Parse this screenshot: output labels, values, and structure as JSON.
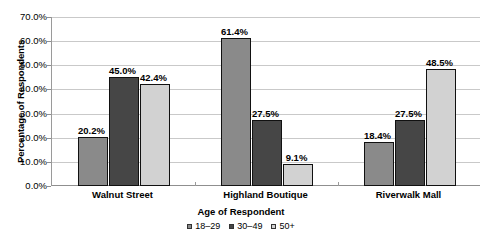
{
  "chart_data": {
    "type": "bar",
    "title": "",
    "xlabel": "Age of Respondent",
    "ylabel": "Percentage of Respondents",
    "categories": [
      "Walnut Street",
      "Highland Boutique",
      "Riverwalk Mall"
    ],
    "series": [
      {
        "name": "18–29",
        "values": [
          20.2,
          45.0,
          18.4
        ],
        "color": "#8a8a8a"
      },
      {
        "name": "30–49",
        "values": [
          27.5,
          27.5,
          27.5
        ],
        "color": "#464646"
      },
      {
        "name": "50+",
        "values": [
          42.4,
          9.1,
          48.5
        ],
        "color": "#d2d2d2"
      }
    ],
    "data_labels": [
      [
        "20.2%",
        "45.0%",
        "42.4%"
      ],
      [
        "61.4%",
        "27.5%",
        "9.1%"
      ],
      [
        "18.4%",
        "27.5%",
        "48.5%"
      ]
    ],
    "ylim": [
      0,
      70
    ],
    "ytick_values": [
      0,
      10,
      20,
      30,
      40,
      50,
      60,
      70
    ],
    "ytick_labels": [
      "0.0%",
      "10.0%",
      "20.0%",
      "30.0%",
      "40.0%",
      "50.0%",
      "60.0%",
      "70.0%"
    ],
    "grid": true,
    "legend_position": "bottom",
    "legend_entries": [
      "18–29",
      "30–49",
      "50+"
    ],
    "values_by_group": [
      [
        20.2,
        45.0,
        42.4
      ],
      [
        61.4,
        27.5,
        9.1
      ],
      [
        18.4,
        27.5,
        48.5
      ]
    ]
  }
}
